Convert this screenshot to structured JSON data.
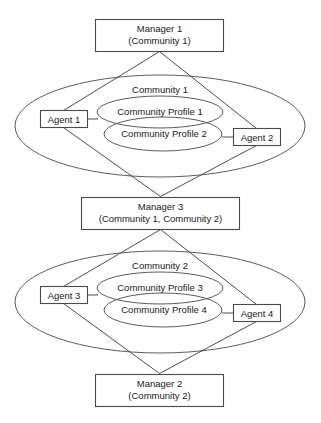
{
  "diagram": {
    "type": "community-agent-manager-structure",
    "background_color": "#ffffff",
    "line_color": "#4a4a4a",
    "text_color": "#1a1a1a",
    "managers": [
      {
        "id": "manager-1",
        "title": "Manager 1",
        "scope": "(Community 1)"
      },
      {
        "id": "manager-3",
        "title": "Manager 3",
        "scope": "(Community 1, Community 2)"
      },
      {
        "id": "manager-2",
        "title": "Manager 2",
        "scope": "(Community 2)"
      }
    ],
    "communities": [
      {
        "id": "community-1",
        "label": "Community 1",
        "profiles": [
          {
            "id": "community-profile-1",
            "label": "Community Profile 1"
          },
          {
            "id": "community-profile-2",
            "label": "Community Profile 2"
          }
        ],
        "agents": [
          {
            "id": "agent-1",
            "label": "Agent 1"
          },
          {
            "id": "agent-2",
            "label": "Agent 2"
          }
        ]
      },
      {
        "id": "community-2",
        "label": "Community 2",
        "profiles": [
          {
            "id": "community-profile-3",
            "label": "Community Profile 3"
          },
          {
            "id": "community-profile-4",
            "label": "Community Profile 4"
          }
        ],
        "agents": [
          {
            "id": "agent-3",
            "label": "Agent 3"
          },
          {
            "id": "agent-4",
            "label": "Agent 4"
          }
        ]
      }
    ]
  }
}
